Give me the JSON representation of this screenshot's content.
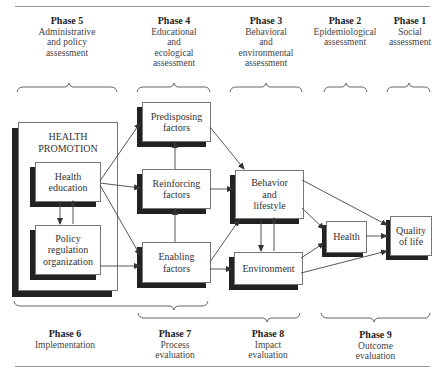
{
  "top_phases": [
    {
      "num": "Phase 5",
      "desc": "Administrative and policy assessment"
    },
    {
      "num": "Phase 4",
      "desc": "Educational and ecological assessment"
    },
    {
      "num": "Phase 3",
      "desc": "Behavioral and environmental assessment"
    },
    {
      "num": "Phase 2",
      "desc": "Epidemiological assessment"
    },
    {
      "num": "Phase 1",
      "desc": "Social assessment"
    }
  ],
  "bottom_phases": [
    {
      "num": "Phase 6",
      "desc": "Implementation"
    },
    {
      "num": "Phase 7",
      "desc": "Process evaluation"
    },
    {
      "num": "Phase 8",
      "desc": "Impact evaluation"
    },
    {
      "num": "Phase 9",
      "desc": "Outcome evaluation"
    }
  ],
  "boxes": {
    "health_promotion": "HEALTH PROMOTION",
    "health_education": "Health education",
    "policy": "Policy regulation organization",
    "predisposing": "Predisposing factors",
    "reinforcing": "Reinforcing factors",
    "enabling": "Enabling factors",
    "behavior": "Behavior and lifestyle",
    "environment": "Environment",
    "health": "Health",
    "quality": "Quality of life"
  },
  "lines": {
    "top_phase5_desc": [
      "Administrative",
      "and policy",
      "assessment"
    ],
    "top_phase4_desc": [
      "Educational",
      "and",
      "ecological",
      "assessment"
    ],
    "top_phase3_desc": [
      "Behavioral",
      "and",
      "environmental",
      "assessment"
    ],
    "top_phase2_desc": [
      "Epidemiological",
      "assessment"
    ],
    "top_phase1_desc": [
      "Social",
      "assessment"
    ],
    "hp_title": [
      "HEALTH",
      "PROMOTION"
    ],
    "health_education": [
      "Health",
      "education"
    ],
    "policy": [
      "Policy",
      "regulation",
      "organization"
    ],
    "predisposing": [
      "Predisposing",
      "factors"
    ],
    "reinforcing": [
      "Reinforcing",
      "factors"
    ],
    "enabling": [
      "Enabling",
      "factors"
    ],
    "behavior": [
      "Behavior",
      "and",
      "lifestyle"
    ],
    "quality": [
      "Quality",
      "of life"
    ],
    "bottom_phase7_desc": [
      "Process",
      "evaluation"
    ],
    "bottom_phase8_desc": [
      "Impact",
      "evaluation"
    ],
    "bottom_phase9_desc": [
      "Outcome",
      "evaluation"
    ]
  }
}
